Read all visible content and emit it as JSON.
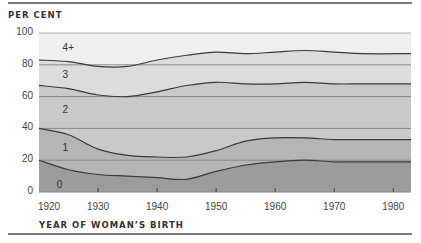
{
  "chart_data": {
    "type": "area",
    "title": "",
    "ylabel": "PER CENT",
    "xlabel": "YEAR OF WOMAN'S BIRTH",
    "ylim": [
      0,
      100
    ],
    "xlim": [
      1920,
      1983
    ],
    "grid": true,
    "y_ticks": [
      "0",
      "20",
      "40",
      "60",
      "80",
      "100"
    ],
    "x_ticks": [
      "1920",
      "1930",
      "1940",
      "1950",
      "1960",
      "1970",
      "1980"
    ],
    "x": [
      1920,
      1925,
      1930,
      1935,
      1940,
      1945,
      1950,
      1955,
      1960,
      1965,
      1970,
      1975,
      1983
    ],
    "stacked": true,
    "series": [
      {
        "name": "0",
        "label_pos": [
          1923,
          5
        ],
        "color": "#9c9c9c",
        "cumulative_top": [
          20,
          14,
          11,
          10,
          9,
          8,
          13,
          17,
          19,
          20,
          19,
          19,
          19
        ]
      },
      {
        "name": "1",
        "label_pos": [
          1924,
          28
        ],
        "color": "#b5b5b5",
        "cumulative_top": [
          40,
          36,
          27,
          23,
          22,
          22,
          26,
          32,
          34,
          34,
          33,
          33,
          33
        ]
      },
      {
        "name": "2",
        "label_pos": [
          1924,
          52
        ],
        "color": "#c9c9c9",
        "cumulative_top": [
          67,
          65,
          61,
          60,
          63,
          67,
          69,
          68,
          68,
          69,
          68,
          68,
          68
        ]
      },
      {
        "name": "3",
        "label_pos": [
          1924,
          74
        ],
        "color": "#dcdcdc",
        "cumulative_top": [
          83,
          82,
          79,
          79,
          83,
          86,
          88,
          87,
          88,
          89,
          88,
          87,
          87
        ]
      },
      {
        "name": "4+",
        "label_pos": [
          1924,
          91
        ],
        "color": "#efefef",
        "cumulative_top": [
          100,
          100,
          100,
          100,
          100,
          100,
          100,
          100,
          100,
          100,
          100,
          100,
          100
        ]
      }
    ],
    "legend": "inline band labels: 0, 1, 2, 3, 4+"
  },
  "axis": {
    "y_title": "PER CENT",
    "x_title": "YEAR OF WOMAN’S BIRTH"
  }
}
